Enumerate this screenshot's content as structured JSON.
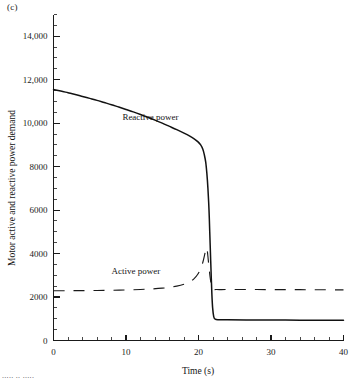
{
  "figure": {
    "panel_label": "(c)",
    "bottom_cut_text": "..... .. ....."
  },
  "chart_data": {
    "type": "line",
    "title": "",
    "xlabel": "Time (s)",
    "ylabel": "Motor active and reactive power demand",
    "xlim": [
      0,
      40
    ],
    "ylim": [
      0,
      15000
    ],
    "grid": false,
    "legend": "inline-annotations",
    "x_ticks": [
      0,
      10,
      20,
      30,
      40
    ],
    "x_tick_labels": [
      "0",
      "10",
      "20",
      "30",
      "40"
    ],
    "x_minor_tick_step": 2,
    "y_ticks": [
      0,
      2000,
      4000,
      6000,
      8000,
      10000,
      12000,
      14000
    ],
    "y_tick_labels": [
      "0",
      "2000",
      "4000",
      "6000",
      "8000",
      "10,000",
      "12,000",
      "14,000"
    ],
    "y_minor_tick_step": 500,
    "annotations": [
      {
        "text": "Reactive power",
        "x": 9.5,
        "y": 10150
      },
      {
        "text": "Active power",
        "x": 8.0,
        "y": 3050
      }
    ],
    "series": [
      {
        "name": "Reactive power",
        "style": "solid",
        "color": "#121212",
        "points": [
          [
            0.0,
            11550
          ],
          [
            1.0,
            11480
          ],
          [
            2.0,
            11400
          ],
          [
            3.0,
            11320
          ],
          [
            4.0,
            11230
          ],
          [
            5.0,
            11140
          ],
          [
            6.0,
            11050
          ],
          [
            7.0,
            10950
          ],
          [
            8.0,
            10850
          ],
          [
            9.0,
            10740
          ],
          [
            10.0,
            10630
          ],
          [
            11.0,
            10520
          ],
          [
            12.0,
            10400
          ],
          [
            13.0,
            10270
          ],
          [
            14.0,
            10140
          ],
          [
            15.0,
            10000
          ],
          [
            16.0,
            9850
          ],
          [
            17.0,
            9700
          ],
          [
            18.0,
            9540
          ],
          [
            18.8,
            9400
          ],
          [
            19.4,
            9280
          ],
          [
            19.9,
            9150
          ],
          [
            20.3,
            9000
          ],
          [
            20.6,
            8800
          ],
          [
            20.8,
            8550
          ],
          [
            21.0,
            8200
          ],
          [
            21.15,
            7700
          ],
          [
            21.3,
            7000
          ],
          [
            21.45,
            6000
          ],
          [
            21.55,
            5000
          ],
          [
            21.65,
            4000
          ],
          [
            21.75,
            3000
          ],
          [
            21.85,
            2100
          ],
          [
            21.95,
            1500
          ],
          [
            22.1,
            1100
          ],
          [
            22.3,
            980
          ],
          [
            22.8,
            955
          ],
          [
            24.0,
            950
          ],
          [
            28.0,
            945
          ],
          [
            32.0,
            940
          ],
          [
            36.0,
            935
          ],
          [
            40.0,
            930
          ]
        ]
      },
      {
        "name": "Active power",
        "style": "dashed",
        "color": "#1a1a1a",
        "points": [
          [
            0.0,
            2290
          ],
          [
            2.0,
            2292
          ],
          [
            4.0,
            2296
          ],
          [
            6.0,
            2302
          ],
          [
            8.0,
            2312
          ],
          [
            10.0,
            2326
          ],
          [
            12.0,
            2348
          ],
          [
            13.5,
            2372
          ],
          [
            15.0,
            2408
          ],
          [
            16.0,
            2445
          ],
          [
            17.0,
            2500
          ],
          [
            18.0,
            2590
          ],
          [
            18.8,
            2700
          ],
          [
            19.4,
            2850
          ],
          [
            19.9,
            3050
          ],
          [
            20.3,
            3300
          ],
          [
            20.6,
            3600
          ],
          [
            20.85,
            3950
          ],
          [
            21.05,
            4250
          ],
          [
            21.2,
            4150
          ],
          [
            21.35,
            3700
          ],
          [
            21.5,
            3200
          ],
          [
            21.65,
            2800
          ],
          [
            21.8,
            2500
          ],
          [
            22.0,
            2360
          ],
          [
            22.5,
            2345
          ],
          [
            24.0,
            2345
          ],
          [
            28.0,
            2345
          ],
          [
            32.0,
            2340
          ],
          [
            36.0,
            2335
          ],
          [
            40.0,
            2330
          ]
        ]
      }
    ]
  }
}
